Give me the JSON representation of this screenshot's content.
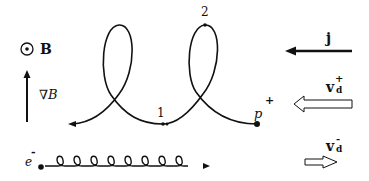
{
  "diagram": {
    "type": "particle drift trajectories in a magnetic field gradient",
    "legend_left": {
      "field_symbol": "⊙",
      "field_label": "B",
      "gradient_label": "∇B"
    },
    "proton": {
      "label": "p",
      "charge": "+",
      "points": [
        {
          "id": "1",
          "label": "1"
        },
        {
          "id": "2",
          "label": "2"
        }
      ]
    },
    "electron": {
      "label": "e",
      "charge": "-"
    },
    "legend_right": {
      "current_label": "j",
      "ion_drift_label": "v",
      "ion_drift_sub": "d",
      "ion_drift_sup": "+",
      "electron_drift_label": "v",
      "electron_drift_sub": "d",
      "electron_drift_sup": "-"
    }
  }
}
